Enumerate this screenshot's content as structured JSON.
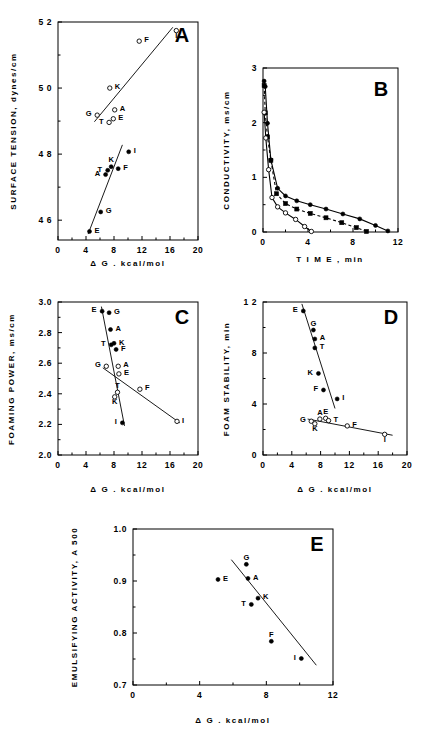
{
  "figure": {
    "background": "#ffffff",
    "foreground": "#000000",
    "panel_letters": [
      "A",
      "B",
      "C",
      "D",
      "E"
    ]
  },
  "axis_titles": {
    "delta_g": "Δ G . kcal/mol",
    "time": "T I M E , min"
  },
  "chart_data": [
    {
      "id": "A",
      "type": "scatter",
      "title": "A",
      "xlabel": "Δ G . kcal/mol",
      "ylabel": "SURFACE TENSION, dynes/cm",
      "xlim": [
        0,
        20
      ],
      "ylim": [
        45.4,
        52
      ],
      "xticks": [
        0,
        4,
        8,
        12,
        16,
        20
      ],
      "yticks": [
        46,
        48,
        50,
        52
      ],
      "ytick_labels": [
        "4 6",
        "4 8",
        "5 0",
        "5 2"
      ],
      "grid": false,
      "legend": "none",
      "series": [
        {
          "name": "open-symbols",
          "marker": "open-circle",
          "points": [
            {
              "label": "G",
              "x": 5.6,
              "y": 49.18,
              "label_pos": "left"
            },
            {
              "label": "T",
              "x": 7.3,
              "y": 48.96,
              "label_pos": "left"
            },
            {
              "label": "E",
              "x": 7.9,
              "y": 49.07,
              "label_pos": "right"
            },
            {
              "label": "A",
              "x": 8.1,
              "y": 49.34,
              "label_pos": "right"
            },
            {
              "label": "K",
              "x": 7.4,
              "y": 50.0,
              "label_pos": "right"
            },
            {
              "label": "F",
              "x": 11.6,
              "y": 51.42,
              "label_pos": "right"
            },
            {
              "label": "I",
              "x": 16.9,
              "y": 51.74,
              "label_pos": "below"
            }
          ],
          "fit_line": {
            "x1": 5.2,
            "y1": 48.98,
            "x2": 16.4,
            "y2": 51.84
          }
        },
        {
          "name": "filled-symbols",
          "marker": "filled-circle",
          "points": [
            {
              "label": "E",
              "x": 4.5,
              "y": 45.66,
              "label_pos": "right"
            },
            {
              "label": "G",
              "x": 6.1,
              "y": 46.25,
              "label_pos": "right"
            },
            {
              "label": "A",
              "x": 6.8,
              "y": 47.38,
              "label_pos": "left"
            },
            {
              "label": "T",
              "x": 7.1,
              "y": 47.51,
              "label_pos": "left"
            },
            {
              "label": "K",
              "x": 7.6,
              "y": 47.62,
              "label_pos": "above"
            },
            {
              "label": "F",
              "x": 8.6,
              "y": 47.56,
              "label_pos": "right"
            },
            {
              "label": "I",
              "x": 10.1,
              "y": 48.07,
              "label_pos": "right"
            }
          ],
          "fit_line": {
            "x1": 4.3,
            "y1": 45.58,
            "x2": 9.2,
            "y2": 48.28
          }
        }
      ]
    },
    {
      "id": "B",
      "type": "line",
      "title": "B",
      "xlabel": "T I M E , min",
      "ylabel": "CONDUCTIVITY, ms/cm",
      "xlim": [
        0,
        12
      ],
      "ylim": [
        0,
        3
      ],
      "xticks": [
        0,
        4,
        8,
        12
      ],
      "yticks": [
        0,
        1,
        2,
        3
      ],
      "grid": false,
      "legend": "none",
      "series": [
        {
          "name": "filled-circles",
          "marker": "filled-circle",
          "style": "solid",
          "x": [
            0.1,
            0.2,
            0.4,
            0.7,
            1.3,
            2.0,
            3.0,
            4.2,
            5.6,
            7.1,
            8.6,
            10.0,
            11.1
          ],
          "y": [
            2.76,
            2.66,
            1.99,
            1.32,
            0.8,
            0.66,
            0.57,
            0.5,
            0.42,
            0.33,
            0.24,
            0.12,
            0.02
          ]
        },
        {
          "name": "filled-squares",
          "marker": "filled-square",
          "style": "dashed",
          "x": [
            0.1,
            0.2,
            0.4,
            0.7,
            1.2,
            2.0,
            3.0,
            4.2,
            5.6,
            7.0,
            8.3,
            9.2
          ],
          "y": [
            2.68,
            2.18,
            1.74,
            1.31,
            0.7,
            0.52,
            0.42,
            0.34,
            0.26,
            0.17,
            0.08,
            0.01
          ]
        },
        {
          "name": "open-circles",
          "marker": "open-circle",
          "style": "solid",
          "x": [
            0.1,
            0.25,
            0.5,
            0.8,
            1.3,
            2.0,
            2.9,
            3.7,
            4.3
          ],
          "y": [
            2.19,
            1.72,
            1.14,
            0.63,
            0.46,
            0.35,
            0.23,
            0.1,
            0.01
          ]
        }
      ]
    },
    {
      "id": "C",
      "type": "scatter",
      "title": "C",
      "xlabel": "Δ G . kcal/mol",
      "ylabel": "FOAMING POWER, ms/cm",
      "xlim": [
        0,
        20
      ],
      "ylim": [
        2.0,
        3.0
      ],
      "xticks": [
        0,
        4,
        8,
        12,
        16,
        20
      ],
      "yticks": [
        2.0,
        2.2,
        2.4,
        2.6,
        2.8,
        3.0
      ],
      "ytick_labels": [
        "2.0",
        "2.2",
        "2.4",
        "2.6",
        "2.8",
        "3.0"
      ],
      "grid": false,
      "legend": "none",
      "series": [
        {
          "name": "filled-symbols",
          "marker": "filled-circle",
          "points": [
            {
              "label": "E",
              "x": 6.3,
              "y": 2.94,
              "label_pos": "left"
            },
            {
              "label": "G",
              "x": 7.3,
              "y": 2.93,
              "label_pos": "right"
            },
            {
              "label": "A",
              "x": 7.5,
              "y": 2.82,
              "label_pos": "right"
            },
            {
              "label": "T",
              "x": 7.6,
              "y": 2.72,
              "label_pos": "left"
            },
            {
              "label": "K",
              "x": 8.0,
              "y": 2.73,
              "label_pos": "right"
            },
            {
              "label": "F",
              "x": 8.3,
              "y": 2.69,
              "label_pos": "right"
            },
            {
              "label": "I",
              "x": 9.2,
              "y": 2.21,
              "label_pos": "left"
            }
          ],
          "fit_line": {
            "x1": 6.2,
            "y1": 2.97,
            "x2": 9.5,
            "y2": 2.19
          }
        },
        {
          "name": "open-symbols",
          "marker": "open-circle",
          "points": [
            {
              "label": "G",
              "x": 6.9,
              "y": 2.58,
              "label_pos": "left"
            },
            {
              "label": "A",
              "x": 8.6,
              "y": 2.58,
              "label_pos": "right"
            },
            {
              "label": "E",
              "x": 8.7,
              "y": 2.53,
              "label_pos": "right"
            },
            {
              "label": "T",
              "x": 8.5,
              "y": 2.41,
              "label_pos": "above"
            },
            {
              "label": "K",
              "x": 8.1,
              "y": 2.38,
              "label_pos": "below"
            },
            {
              "label": "F",
              "x": 11.7,
              "y": 2.43,
              "label_pos": "right"
            },
            {
              "label": "I",
              "x": 17.0,
              "y": 2.22,
              "label_pos": "right"
            }
          ],
          "fit_line": {
            "x1": 6.4,
            "y1": 2.57,
            "x2": 17.4,
            "y2": 2.21
          }
        }
      ]
    },
    {
      "id": "D",
      "type": "scatter",
      "title": "D",
      "xlabel": "Δ G . kcal/mol",
      "ylabel": "FOAM STABILITY, min",
      "xlim": [
        0,
        20
      ],
      "ylim": [
        0,
        12
      ],
      "xticks": [
        0,
        4,
        8,
        12,
        16,
        20
      ],
      "yticks": [
        0,
        4,
        8,
        12
      ],
      "ytick_labels": [
        "0",
        "4",
        "8",
        "1 2"
      ],
      "grid": false,
      "legend": "none",
      "series": [
        {
          "name": "filled-symbols",
          "marker": "filled-circle",
          "points": [
            {
              "label": "E",
              "x": 5.6,
              "y": 11.3,
              "label_pos": "left"
            },
            {
              "label": "G",
              "x": 7.0,
              "y": 9.8,
              "label_pos": "above"
            },
            {
              "label": "A",
              "x": 7.2,
              "y": 9.1,
              "label_pos": "right"
            },
            {
              "label": "T",
              "x": 7.2,
              "y": 8.4,
              "label_pos": "right"
            },
            {
              "label": "K",
              "x": 7.7,
              "y": 6.4,
              "label_pos": "left"
            },
            {
              "label": "F",
              "x": 8.4,
              "y": 5.1,
              "label_pos": "left"
            },
            {
              "label": "I",
              "x": 10.3,
              "y": 4.4,
              "label_pos": "right"
            }
          ],
          "fit_line": {
            "x1": 5.4,
            "y1": 11.85,
            "x2": 10.0,
            "y2": 3.65
          }
        },
        {
          "name": "open-symbols",
          "marker": "open-circle",
          "points": [
            {
              "label": "G",
              "x": 6.7,
              "y": 2.65,
              "label_pos": "left"
            },
            {
              "label": "K",
              "x": 7.2,
              "y": 2.45,
              "label_pos": "below"
            },
            {
              "label": "A",
              "x": 7.9,
              "y": 2.82,
              "label_pos": "above"
            },
            {
              "label": "E",
              "x": 8.7,
              "y": 2.88,
              "label_pos": "above"
            },
            {
              "label": "T",
              "x": 9.1,
              "y": 2.7,
              "label_pos": "right"
            },
            {
              "label": "F",
              "x": 11.7,
              "y": 2.28,
              "label_pos": "right"
            },
            {
              "label": "I",
              "x": 16.9,
              "y": 1.62,
              "label_pos": "below"
            }
          ],
          "fit_line": {
            "x1": 6.2,
            "y1": 2.82,
            "x2": 18.0,
            "y2": 1.55
          }
        }
      ]
    },
    {
      "id": "E",
      "type": "scatter",
      "title": "E",
      "xlabel": "Δ G . kcal/mol",
      "ylabel": "EMULSIFYING ACTIVITY, A 500",
      "xlim": [
        0,
        12
      ],
      "ylim": [
        0.7,
        1.0
      ],
      "xticks": [
        0,
        4,
        8,
        12
      ],
      "yticks": [
        0.7,
        0.8,
        0.9,
        1.0
      ],
      "ytick_labels": [
        "0.7",
        "0.8",
        "0.9",
        "1.0"
      ],
      "grid": false,
      "legend": "none",
      "series": [
        {
          "name": "filled-symbols",
          "marker": "filled-circle",
          "points": [
            {
              "label": "E",
              "x": 5.1,
              "y": 0.903,
              "label_pos": "right"
            },
            {
              "label": "G",
              "x": 6.8,
              "y": 0.932,
              "label_pos": "above"
            },
            {
              "label": "A",
              "x": 6.9,
              "y": 0.905,
              "label_pos": "right"
            },
            {
              "label": "K",
              "x": 7.5,
              "y": 0.867,
              "label_pos": "right"
            },
            {
              "label": "T",
              "x": 7.1,
              "y": 0.855,
              "label_pos": "left"
            },
            {
              "label": "F",
              "x": 8.3,
              "y": 0.784,
              "label_pos": "above"
            },
            {
              "label": "I",
              "x": 10.1,
              "y": 0.751,
              "label_pos": "left"
            }
          ],
          "fit_line": {
            "x1": 5.9,
            "y1": 0.941,
            "x2": 11.0,
            "y2": 0.738
          }
        }
      ]
    }
  ]
}
